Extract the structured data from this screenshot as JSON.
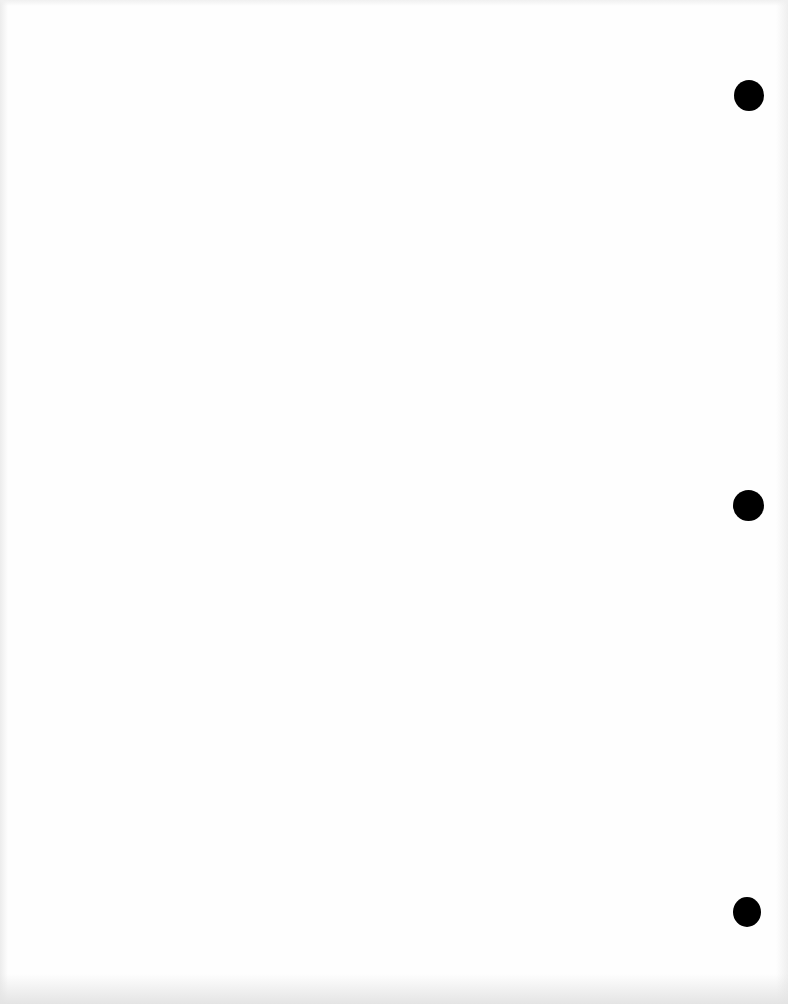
{
  "document": {
    "type": "blank scanned page",
    "background_color": "#fefefe",
    "text": ""
  },
  "punch_holes": [
    {
      "position": "top",
      "cx": 749,
      "cy": 95,
      "w": 30,
      "h": 31,
      "color": "#000000"
    },
    {
      "position": "middle",
      "cx": 748,
      "cy": 505,
      "w": 31,
      "h": 31,
      "color": "#000000"
    },
    {
      "position": "bottom",
      "cx": 747,
      "cy": 912,
      "w": 28,
      "h": 30,
      "color": "#000000"
    }
  ]
}
